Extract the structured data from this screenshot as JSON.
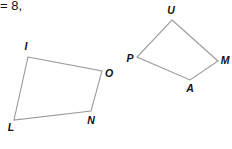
{
  "header": {
    "text": "= 8,"
  },
  "shapes": [
    {
      "name": "quadrilateral-ILNO",
      "vertices": [
        {
          "label": "I",
          "x": 28,
          "y": 57,
          "lx": 26,
          "ly": 50
        },
        {
          "label": "O",
          "x": 102,
          "y": 71,
          "lx": 109,
          "ly": 77
        },
        {
          "label": "N",
          "x": 91,
          "y": 111,
          "lx": 91,
          "ly": 124
        },
        {
          "label": "L",
          "x": 14,
          "y": 120,
          "lx": 11,
          "ly": 131
        }
      ]
    },
    {
      "name": "quadrilateral-UPAM",
      "vertices": [
        {
          "label": "U",
          "x": 172,
          "y": 20,
          "lx": 171,
          "ly": 14
        },
        {
          "label": "M",
          "x": 218,
          "y": 61,
          "lx": 225,
          "ly": 64
        },
        {
          "label": "A",
          "x": 190,
          "y": 80,
          "lx": 190,
          "ly": 92
        },
        {
          "label": "P",
          "x": 137,
          "y": 57,
          "lx": 130,
          "ly": 62
        }
      ]
    }
  ],
  "colors": {
    "edge": "#9a9a9a",
    "label": "#111111"
  }
}
